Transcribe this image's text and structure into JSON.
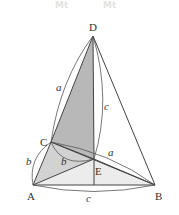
{
  "watermark": [
    "Mt",
    "Mt"
  ],
  "points": {
    "D": {
      "label": "D",
      "x": 93,
      "y": 36
    },
    "C": {
      "label": "C",
      "x": 51,
      "y": 142
    },
    "E": {
      "label": "E",
      "x": 94,
      "y": 159
    },
    "A": {
      "label": "A",
      "x": 33,
      "y": 185
    },
    "B": {
      "label": "B",
      "x": 155,
      "y": 185
    }
  },
  "edge_labels": {
    "DC": "a",
    "DE": "c",
    "CE": "a",
    "CA": "b",
    "CE_inner": "b",
    "AB": "c"
  },
  "colors": {
    "line": "#444444",
    "shade_dark": "#b8b8b8",
    "shade_light": "#e6e6e6",
    "label": "#333333"
  }
}
